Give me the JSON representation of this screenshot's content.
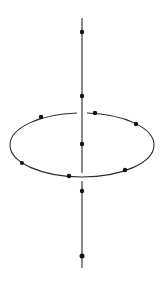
{
  "diagram": {
    "colors": {
      "line": "#2a2a2a",
      "dot": "#111111",
      "background": "#ffffff"
    },
    "axis": {
      "x": 82,
      "y_top": 18,
      "y_bottom": 268
    },
    "ring": {
      "cx": 82,
      "cy": 145,
      "rx": 72,
      "ry": 32
    },
    "axis_points": [
      {
        "x": 82,
        "y": 32,
        "r": 2.2
      },
      {
        "x": 82,
        "y": 96,
        "r": 2.2
      },
      {
        "x": 82,
        "y": 144,
        "r": 2.2
      },
      {
        "x": 82,
        "y": 191,
        "r": 2.2
      },
      {
        "x": 82,
        "y": 256,
        "r": 2.5
      }
    ],
    "ring_points": [
      {
        "x": 41,
        "y": 117,
        "r": 2.2
      },
      {
        "x": 95,
        "y": 113,
        "r": 2.2
      },
      {
        "x": 136,
        "y": 124,
        "r": 2.2
      },
      {
        "x": 22,
        "y": 163,
        "r": 2.0
      },
      {
        "x": 69,
        "y": 176,
        "r": 2.2
      },
      {
        "x": 125,
        "y": 170,
        "r": 2.2
      }
    ]
  }
}
